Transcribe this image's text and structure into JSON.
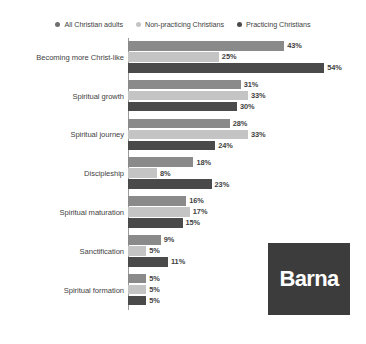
{
  "chart_data": {
    "type": "bar",
    "orientation": "horizontal",
    "title": "",
    "xlabel": "",
    "ylabel": "",
    "grid": false,
    "legend_position": "top",
    "xlim": [
      0,
      60
    ],
    "value_suffix": "%",
    "categories": [
      "Becoming more Christ-like",
      "Spiritual growth",
      "Spiritual journey",
      "Discipleship",
      "Spiritual maturation",
      "Sanctification",
      "Spiritual formation"
    ],
    "series": [
      {
        "name": "All Christian adults",
        "color": "#8a8a8a",
        "values": [
          43,
          31,
          28,
          18,
          16,
          9,
          5
        ],
        "labels": [
          "43%",
          "31%",
          "28%",
          "18%",
          "16%",
          "9%",
          "5%"
        ]
      },
      {
        "name": "Non-practicing Christians",
        "color": "#c4c4c4",
        "values": [
          25,
          33,
          33,
          8,
          17,
          5,
          5
        ],
        "labels": [
          "25%",
          "33%",
          "33%",
          "8%",
          "17%",
          "5%",
          "5%"
        ]
      },
      {
        "name": "Practicing Christians",
        "color": "#4a4a4a",
        "values": [
          54,
          30,
          24,
          23,
          15,
          11,
          5
        ],
        "labels": [
          "54%",
          "30%",
          "24%",
          "23%",
          "15%",
          "11%",
          "5%"
        ]
      }
    ]
  },
  "legend": {
    "items": [
      {
        "label": "All Christian adults",
        "color": "#6e6e6e"
      },
      {
        "label": "Non-practicing Christians",
        "color": "#c4c4c4"
      },
      {
        "label": "Practicing Christians",
        "color": "#4a4a4a"
      }
    ]
  },
  "logo": {
    "text": "Barna",
    "background": "#3c3c3c",
    "text_color": "#ffffff"
  },
  "axis": {
    "line_color": "#9a9a9a"
  }
}
